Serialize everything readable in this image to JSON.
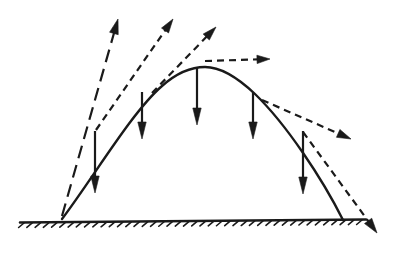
{
  "figure": {
    "background_color": "#ffffff",
    "stroke_color": "#1a1a1a",
    "width": 396,
    "height": 253
  },
  "ground": {
    "name": "ground-line",
    "x_start": 20,
    "x_end": 366,
    "y": 221,
    "stroke_width": 2.6,
    "hatch": {
      "count": 42,
      "length": 7,
      "angle_deg": 40,
      "stroke_width": 1.6,
      "x_start": 24,
      "x_end": 362
    }
  },
  "trajectory": {
    "name": "projectile-path",
    "style": "solid",
    "stroke_width": 2.4,
    "launch_point": {
      "x": 62,
      "y": 219
    },
    "apex_point": {
      "x": 205,
      "y": 67
    },
    "landing_point": {
      "x": 343,
      "y": 220
    },
    "path": "M 62 219 C 95 175 132 112 162 86 C 180 70 195 67 205 67 C 218 67 236 76 255 94 C 286 124 322 178 343 220"
  },
  "gravity_vectors": {
    "name": "gravity-acceleration-arrows",
    "label": "downward gravity vectors",
    "style": "solid",
    "stroke_width": 2.2,
    "head_length": 17,
    "head_half_width": 4.2,
    "arrows": [
      {
        "name": "gravity-arrow-1",
        "x": 95,
        "y_start": 131,
        "y_end": 193
      },
      {
        "name": "gravity-arrow-2",
        "x": 142,
        "y_start": 92,
        "y_end": 139
      },
      {
        "name": "gravity-arrow-3",
        "x": 197,
        "y_start": 68,
        "y_end": 125
      },
      {
        "name": "gravity-arrow-4",
        "x": 253,
        "y_start": 92,
        "y_end": 139
      },
      {
        "name": "gravity-arrow-5",
        "x": 303,
        "y_start": 131,
        "y_end": 194
      }
    ]
  },
  "velocity_vectors": {
    "name": "velocity-tangent-arrows",
    "label": "velocity vectors tangent to the path",
    "arrows": [
      {
        "name": "velocity-arrow-launch",
        "style": "long-dash",
        "dash_pattern": "13,7",
        "stroke_width": 2.2,
        "x_start": 62,
        "y_start": 216,
        "x_end": 118,
        "y_end": 19,
        "head_length": 15,
        "head_half_width": 4.5
      },
      {
        "name": "velocity-arrow-rising-1",
        "style": "dash",
        "dash_pattern": "7,5",
        "stroke_width": 2.2,
        "x_start": 96,
        "y_start": 130,
        "x_end": 173,
        "y_end": 19,
        "head_length": 14,
        "head_half_width": 4.3
      },
      {
        "name": "velocity-arrow-rising-2",
        "style": "dash",
        "dash_pattern": "7,5",
        "stroke_width": 2.2,
        "x_start": 152,
        "y_start": 93,
        "x_end": 216,
        "y_end": 27,
        "head_length": 14,
        "head_half_width": 4.3
      },
      {
        "name": "velocity-arrow-apex-horizontal",
        "style": "dash",
        "dash_pattern": "7,5",
        "stroke_width": 2.2,
        "x_start": 205,
        "y_start": 61,
        "x_end": 270,
        "y_end": 59,
        "head_length": 13,
        "head_half_width": 4.2
      },
      {
        "name": "velocity-arrow-falling-1",
        "style": "dash",
        "dash_pattern": "7,5",
        "stroke_width": 2.2,
        "x_start": 262,
        "y_start": 100,
        "x_end": 351,
        "y_end": 139,
        "head_length": 14,
        "head_half_width": 4.3
      },
      {
        "name": "velocity-arrow-landing",
        "style": "dash",
        "dash_pattern": "7,5",
        "stroke_width": 2.2,
        "x_start": 303,
        "y_start": 132,
        "x_end": 377,
        "y_end": 233,
        "head_length": 15,
        "head_half_width": 4.5
      }
    ]
  }
}
